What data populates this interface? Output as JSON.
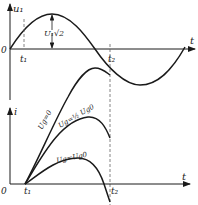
{
  "top_graph": {
    "y_axis_label": "u₁",
    "x_axis_label": "t",
    "origin_label": "0",
    "t1_label": "t₁",
    "t2_label": "t₂",
    "amplitude_label": "U₁√2",
    "curve": "sine"
  },
  "bottom_graph": {
    "y_axis_label": "i",
    "x_axis_label": "t",
    "origin_label": "0",
    "t1_label": "t₁",
    "t2_label": "t₂",
    "curves": [
      {
        "label": "Ug=0"
      },
      {
        "label": "Ug=½ Ug0"
      },
      {
        "label": "Ug=Ug0"
      }
    ]
  },
  "colors": {
    "line": "#1a1a1a",
    "dashed": "#666666",
    "background": "#ffffff"
  }
}
